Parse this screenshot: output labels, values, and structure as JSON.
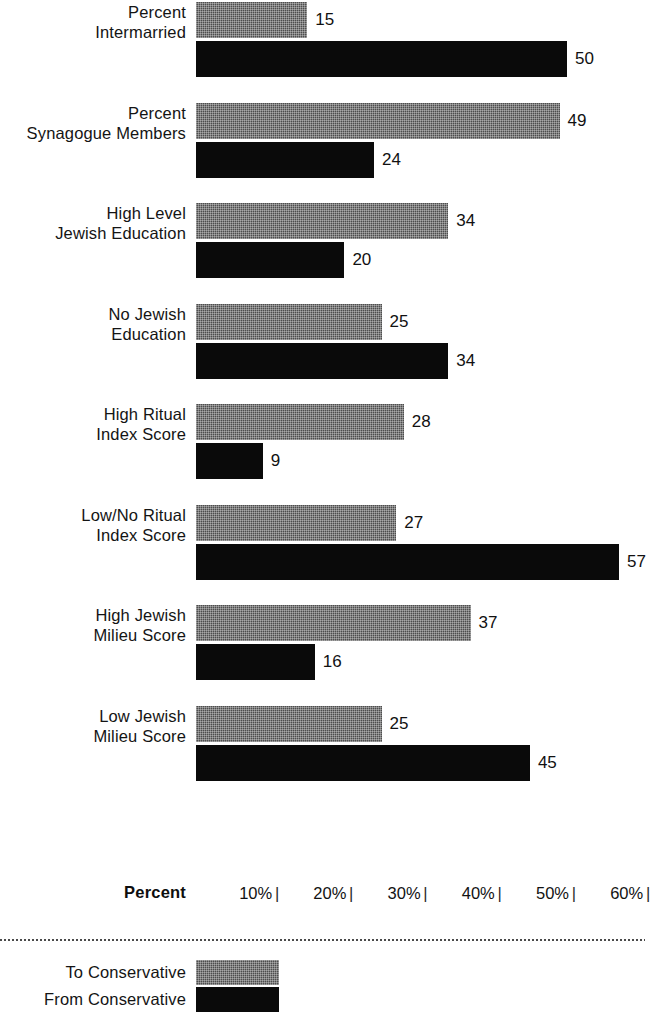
{
  "chart_data": {
    "type": "bar",
    "orientation": "horizontal",
    "title": "",
    "subtitle": "",
    "xlabel": "Percent",
    "ylabel": "",
    "xlim": [
      0,
      65
    ],
    "grid": false,
    "legend_position": "bottom-left",
    "axis_ticks": [
      "10%",
      "20%",
      "30%",
      "40%",
      "50%",
      "60%"
    ],
    "tick_values": [
      10,
      20,
      30,
      40,
      50,
      60
    ],
    "tick_mark_glyph": "|",
    "categories": [
      "Percent\nIntermarried",
      "Percent\nSynagogue Members",
      "High Level\nJewish Education",
      "No Jewish\nEducation",
      "High Ritual\nIndex Score",
      "Low/No Ritual\nIndex Score",
      "High Jewish\nMilieu Score",
      "Low Jewish\nMilieu Score"
    ],
    "series": [
      {
        "name": "To Conservative",
        "color": "#4d4d4d",
        "values": [
          15,
          49,
          34,
          25,
          28,
          27,
          37,
          25
        ]
      },
      {
        "name": "From Conservative",
        "color": "#0a0a0a",
        "values": [
          50,
          24,
          20,
          34,
          9,
          57,
          16,
          45
        ]
      }
    ]
  },
  "legend": {
    "items": [
      {
        "label": "To Conservative",
        "swatch": "gray"
      },
      {
        "label": "From Conservative",
        "swatch": "black"
      }
    ]
  }
}
